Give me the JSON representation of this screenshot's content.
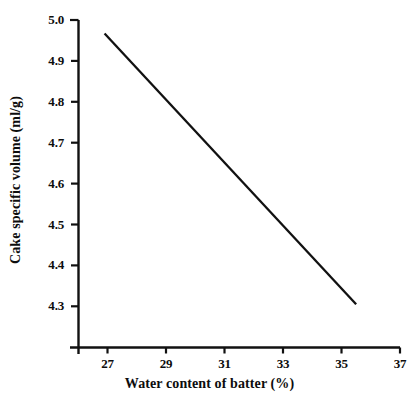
{
  "chart_data": {
    "type": "line",
    "title": "",
    "xlabel": "Water content of batter (%)",
    "ylabel": "Cake specific volume (ml/g)",
    "xlim": [
      26.0,
      37.0
    ],
    "ylim": [
      4.195,
      5.0
    ],
    "xticks": [
      27,
      29,
      31,
      33,
      35,
      37
    ],
    "xtick_labels": [
      "27",
      "29",
      "31",
      "33",
      "35",
      "37"
    ],
    "yticks": [
      4.3,
      4.4,
      4.5,
      4.6,
      4.7,
      4.8,
      4.9,
      5.0
    ],
    "ytick_labels": [
      "4.3",
      "4.4",
      "4.5",
      "4.6",
      "4.7",
      "4.8",
      "4.9",
      "5.0"
    ],
    "grid": false,
    "legend": null,
    "series": [
      {
        "name": "Cake specific volume",
        "color": "#111111",
        "line_width": 2.3,
        "x": [
          26.9,
          35.5
        ],
        "values": [
          4.967,
          4.305
        ]
      }
    ],
    "annotations": []
  }
}
